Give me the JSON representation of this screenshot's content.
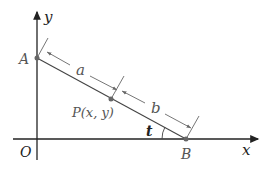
{
  "diagram": {
    "axes": {
      "x_label": "x",
      "y_label": "y",
      "origin_label": "O"
    },
    "points": {
      "A": {
        "label": "A"
      },
      "B": {
        "label": "B"
      },
      "P": {
        "label": "P(x, y)"
      }
    },
    "segments": {
      "a_label": "a",
      "b_label": "b"
    },
    "angle": {
      "label": "t"
    },
    "colors": {
      "line": "#444444",
      "axis": "#222222",
      "label": "#555555"
    }
  }
}
